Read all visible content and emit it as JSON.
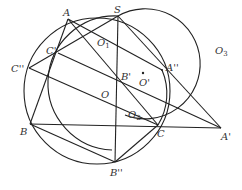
{
  "diagram": {
    "type": "geometry",
    "colors": {
      "stroke": "#222222",
      "label": "#333333",
      "background": "#ffffff"
    },
    "points": {
      "A": {
        "label": "A",
        "x": 68,
        "y": 19
      },
      "S": {
        "label": "S",
        "x": 118,
        "y": 16
      },
      "C1": {
        "label": "C'",
        "x": 58,
        "y": 53
      },
      "C2": {
        "label": "C''",
        "x": 29,
        "y": 68
      },
      "B": {
        "label": "B",
        "x": 30,
        "y": 124
      },
      "B1": {
        "label": "B'",
        "x": 117,
        "y": 81
      },
      "B2": {
        "label": "B''",
        "x": 115,
        "y": 162
      },
      "C": {
        "label": "C",
        "x": 158,
        "y": 125
      },
      "A1": {
        "label": "A'",
        "x": 221,
        "y": 128
      },
      "A2": {
        "label": "A''",
        "x": 162,
        "y": 70
      },
      "O": {
        "label": "O",
        "x": 108,
        "y": 96
      },
      "Op": {
        "label": "O'",
        "x": 144,
        "y": 72
      }
    },
    "labels": {
      "A": "A",
      "S": "S",
      "C1": "C'",
      "C2": "C''",
      "B": "B",
      "B1": "B'",
      "B2": "B''",
      "C": "C",
      "A1": "A'",
      "A2": "A''",
      "O": "O",
      "Op": "O'",
      "O1": "O",
      "O1_sub": "1",
      "O2": "O",
      "O2_sub": "2",
      "O3": "O",
      "O3_sub": "3"
    },
    "circles": [
      {
        "name": "circumcircle",
        "cx": 97,
        "cy": 92,
        "r": 74
      },
      {
        "name": "circle-O1",
        "cx": 160,
        "cy": 88,
        "r": 60
      },
      {
        "name": "circle-O3",
        "cx": 165,
        "cy": 60,
        "r": 58
      }
    ]
  }
}
